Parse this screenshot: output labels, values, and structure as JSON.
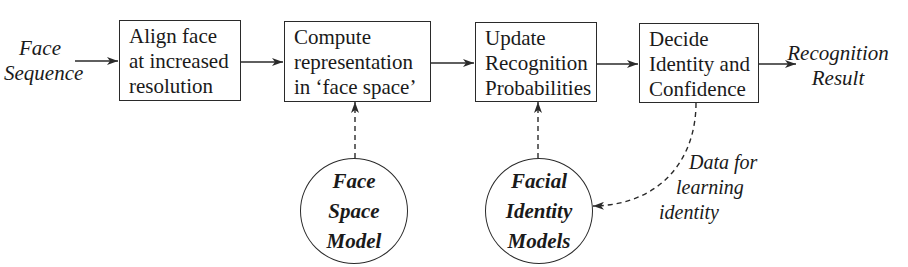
{
  "diagram": {
    "input": {
      "lines": [
        "Face",
        "Sequence"
      ]
    },
    "output": {
      "lines": [
        "Recognition",
        "Result"
      ]
    },
    "steps": [
      {
        "lines": [
          "Align face",
          "at increased",
          "resolution"
        ]
      },
      {
        "lines": [
          "Compute",
          "representation",
          "in ‘face space’"
        ]
      },
      {
        "lines": [
          "Update",
          "Recognition",
          "Probabilities"
        ]
      },
      {
        "lines": [
          "Decide",
          "Identity and",
          "Confidence"
        ]
      }
    ],
    "models": [
      {
        "lines": [
          "Face",
          "Space",
          "Model"
        ]
      },
      {
        "lines": [
          "Facial",
          "Identity",
          "Models"
        ]
      }
    ],
    "feedback_label": {
      "lines": [
        "Data for",
        "learning",
        "identity"
      ]
    },
    "colors": {
      "line": "#2a2a2a",
      "text": "#1a1a1a",
      "background": "#ffffff"
    }
  }
}
